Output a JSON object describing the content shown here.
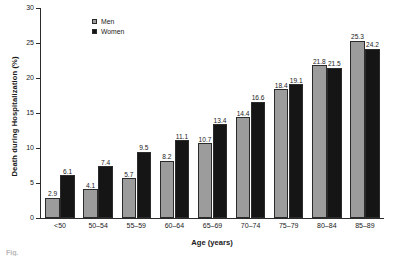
{
  "chart_data": {
    "type": "bar",
    "title": "",
    "xlabel": "Age (years)",
    "ylabel": "Death during Hospitalization (%)",
    "categories": [
      "<50",
      "50–54",
      "55–59",
      "60–64",
      "65–69",
      "70–74",
      "75–79",
      "80–84",
      "85–89"
    ],
    "series": [
      {
        "name": "Men",
        "color": "#9c9c9c",
        "values": [
          2.9,
          4.1,
          5.7,
          8.2,
          10.7,
          14.4,
          18.4,
          21.8,
          25.3
        ]
      },
      {
        "name": "Women",
        "color": "#151515",
        "values": [
          6.1,
          7.4,
          9.5,
          11.1,
          13.4,
          16.6,
          19.1,
          21.5,
          24.2
        ]
      }
    ],
    "ylim": [
      0,
      30
    ],
    "yticks": [
      0,
      5,
      10,
      15,
      20,
      25,
      30
    ],
    "ytick_labels": [
      "0",
      "5",
      "10",
      "15",
      "20",
      "25",
      "30"
    ],
    "grid": false,
    "legend_position": "top-left-inside",
    "data_labels": true
  },
  "caption": {
    "text": "Fig."
  }
}
